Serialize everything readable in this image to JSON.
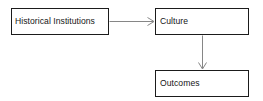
{
  "diagram": {
    "background_color": "#ffffff",
    "box_border_color": "#1b1b1b",
    "arrow_color": "#868686",
    "text_color": "#151515",
    "nodes": [
      {
        "id": "historical-institutions",
        "label": "Historical Institutions"
      },
      {
        "id": "culture",
        "label": "Culture"
      },
      {
        "id": "outcomes",
        "label": "Outcomes"
      }
    ],
    "edges": [
      {
        "id": "historical-institutions-to-culture",
        "from": "Historical Institutions",
        "to": "Culture",
        "direction": "right"
      },
      {
        "id": "culture-to-outcomes",
        "from": "Culture",
        "to": "Outcomes",
        "direction": "down"
      }
    ]
  }
}
